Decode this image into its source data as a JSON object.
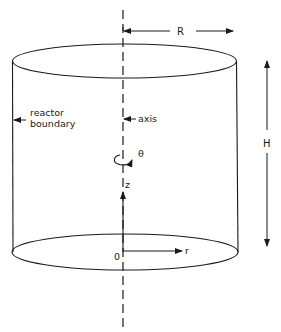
{
  "diagram": {
    "type": "cylindrical reactor coordinate system",
    "colors": {
      "stroke": "#1a1a1a",
      "background": "#ffffff"
    },
    "labels": {
      "radius": "R",
      "height": "H",
      "reactor_boundary_line1": "reactor",
      "reactor_boundary_line2": "boundary",
      "axis": "axis",
      "theta": "θ",
      "z": "z",
      "origin": "0",
      "r": "r"
    }
  }
}
